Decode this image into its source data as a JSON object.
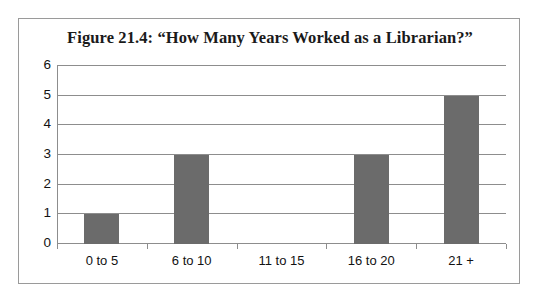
{
  "figure": {
    "title": "Figure 21.4: “How Many Years Worked as a Librarian?”",
    "frame_border_color": "#9a9a9a",
    "background_color": "#ffffff"
  },
  "chart_data": {
    "type": "bar",
    "title": "Figure 21.4: “How Many Years Worked as a Librarian?”",
    "categories": [
      "0 to 5",
      "6 to 10",
      "11 to 15",
      "16 to 20",
      "21 +"
    ],
    "values": [
      1,
      3,
      0,
      3,
      5
    ],
    "xlabel": "",
    "ylabel": "",
    "ylim": [
      0,
      6
    ],
    "ytick_labels": [
      "0",
      "1",
      "2",
      "3",
      "4",
      "5",
      "6"
    ],
    "ytick_values": [
      0,
      1,
      2,
      3,
      4,
      5,
      6
    ],
    "grid": "horizontal",
    "legend": "none",
    "bar_color": "#6b6b6b",
    "gridline_color": "#8d8d8d",
    "axis_color": "#8d8d8d",
    "text_color": "#121212"
  }
}
